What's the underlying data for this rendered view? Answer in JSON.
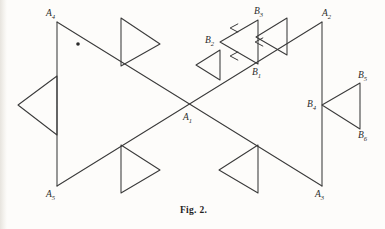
{
  "figure": {
    "caption": "Fig. 2.",
    "caption_x": 180,
    "caption_y": 205,
    "stroke_color": "#3a3a3a",
    "label_color": "#2b2b2b",
    "background_color": "#fdfcfa",
    "width": 385,
    "height": 229,
    "type": "line-diagram",
    "vertices": [
      {
        "id": "A4",
        "base": "A",
        "sub": "4",
        "x": 57,
        "y": 22,
        "label_x": 46,
        "label_y": 8,
        "name": "vertex-label-a4"
      },
      {
        "id": "A2",
        "base": "A",
        "sub": "2",
        "x": 322,
        "y": 22,
        "label_x": 322,
        "label_y": 8,
        "name": "vertex-label-a2"
      },
      {
        "id": "A5",
        "base": "A",
        "sub": "5",
        "x": 57,
        "y": 186,
        "label_x": 46,
        "label_y": 189,
        "name": "vertex-label-a5"
      },
      {
        "id": "A3",
        "base": "A",
        "sub": "3",
        "x": 322,
        "y": 186,
        "label_x": 315,
        "label_y": 189,
        "name": "vertex-label-a3"
      },
      {
        "id": "A1",
        "base": "A",
        "sub": "1",
        "x": 190,
        "y": 104,
        "label_x": 183,
        "label_y": 112,
        "name": "vertex-label-a1"
      },
      {
        "id": "B1",
        "base": "B",
        "sub": "1",
        "x": 258,
        "y": 64,
        "label_x": 252,
        "label_y": 67,
        "name": "vertex-label-b1"
      },
      {
        "id": "B2",
        "base": "B",
        "sub": "2",
        "x": 220,
        "y": 42,
        "label_x": 205,
        "label_y": 35,
        "name": "vertex-label-b2"
      },
      {
        "id": "B3",
        "base": "B",
        "sub": "3",
        "x": 258,
        "y": 20,
        "label_x": 254,
        "label_y": 6,
        "name": "vertex-label-b3"
      },
      {
        "id": "B4",
        "base": "B",
        "sub": "4",
        "x": 322,
        "y": 105,
        "label_x": 307,
        "label_y": 99,
        "name": "vertex-label-b4"
      },
      {
        "id": "B5",
        "base": "B",
        "sub": "5",
        "x": 360,
        "y": 83,
        "label_x": 358,
        "label_y": 70,
        "name": "vertex-label-b5"
      },
      {
        "id": "B6",
        "base": "B",
        "sub": "6",
        "x": 360,
        "y": 129,
        "label_x": 358,
        "label_y": 130,
        "name": "vertex-label-b6"
      }
    ],
    "main_lines": [
      {
        "name": "line-a4-a5",
        "x1": 57,
        "y1": 22,
        "x2": 57,
        "y2": 186
      },
      {
        "name": "line-a2-a3",
        "x1": 322,
        "y1": 22,
        "x2": 322,
        "y2": 186
      },
      {
        "name": "line-a4-a3",
        "x1": 57,
        "y1": 22,
        "x2": 322,
        "y2": 186
      },
      {
        "name": "line-a5-a2",
        "x1": 57,
        "y1": 186,
        "x2": 322,
        "y2": 22
      }
    ],
    "flag_triangles": [
      {
        "name": "flag-triangle-left",
        "points": "57,76 57,135 18,105",
        "note": "points right, apex on left vertical"
      },
      {
        "name": "flag-triangle-top-left",
        "points": "121,18 121,66 160,44",
        "note": "points right, above descending diagonal"
      },
      {
        "name": "flag-triangle-bottom-left",
        "points": "121,145 121,193 160,170",
        "note": "points right, below ascending diagonal"
      },
      {
        "name": "flag-triangle-bottom-right",
        "points": "258,145 258,193 219,170",
        "note": "points left, below descending diagonal"
      },
      {
        "name": "flag-triangle-top-right",
        "points": "287,18 287,55 256,37",
        "note": "points left, above ascending diagonal"
      },
      {
        "name": "flag-triangle-mid",
        "points": "220,50 220,80 196,65",
        "note": "small, points left, above ascending diagonal"
      }
    ],
    "b_triangle_upper": {
      "name": "triangle-b1-b2-b3",
      "points": "258,64 220,42 258,20",
      "arrow_marks": [
        {
          "name": "arrow-mark-b3-b2",
          "x": 233,
          "y": 28,
          "dir": "left"
        },
        {
          "name": "arrow-mark-b2-b1",
          "x": 233,
          "y": 56,
          "dir": "left"
        },
        {
          "name": "arrow-mark-b3-b1",
          "x": 258,
          "y": 42,
          "dir": "left"
        }
      ]
    },
    "b_triangle_right": {
      "name": "triangle-b4-b5-b6",
      "points": "322,105 360,83 360,129"
    },
    "dot_mark": {
      "name": "dot-mark",
      "x": 78,
      "y": 44,
      "r": 1.8
    }
  }
}
